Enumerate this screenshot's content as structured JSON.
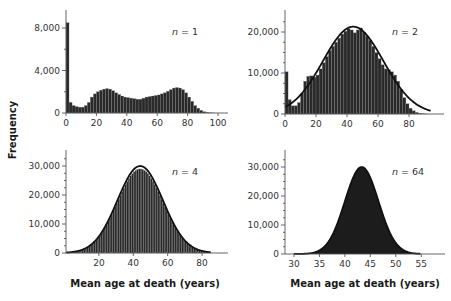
{
  "figure": {
    "ylabel": "Frequency",
    "xlabel": "Mean age at death (years)"
  },
  "chart_data": [
    {
      "type": "bar",
      "panel": "top-left",
      "annotation": "n = 1",
      "n_label": "n",
      "n_value": "= 1",
      "xlabel": "",
      "ylabel": "Frequency",
      "xticks": [
        0,
        20,
        40,
        60,
        80,
        100
      ],
      "yticks": [
        0,
        4000,
        8000
      ],
      "ytick_labels": [
        "0",
        "4,000",
        "8,000"
      ],
      "xlim": [
        0,
        106
      ],
      "ylim": [
        0,
        8000
      ],
      "bin_width": 2,
      "x": [
        0,
        2,
        4,
        6,
        8,
        10,
        12,
        14,
        16,
        18,
        20,
        22,
        24,
        26,
        28,
        30,
        32,
        34,
        36,
        38,
        40,
        42,
        44,
        46,
        48,
        50,
        52,
        54,
        56,
        58,
        60,
        62,
        64,
        66,
        68,
        70,
        72,
        74,
        76,
        78,
        80,
        82,
        84,
        86,
        88,
        90,
        92,
        94,
        96
      ],
      "values": [
        8500,
        1000,
        700,
        600,
        550,
        550,
        700,
        1000,
        1500,
        1800,
        2000,
        2150,
        2250,
        2300,
        2250,
        2100,
        1900,
        1750,
        1600,
        1500,
        1450,
        1400,
        1350,
        1300,
        1300,
        1400,
        1500,
        1550,
        1600,
        1650,
        1700,
        1800,
        1900,
        2050,
        2200,
        2350,
        2400,
        2350,
        2200,
        1900,
        1500,
        1100,
        700,
        450,
        250,
        130,
        60,
        20,
        5
      ],
      "grid": false
    },
    {
      "type": "bar",
      "panel": "top-right",
      "annotation": "n = 2",
      "n_label": "n",
      "n_value": "= 2",
      "xticks": [
        0,
        20,
        40,
        60,
        80
      ],
      "yticks": [
        0,
        10000,
        20000
      ],
      "ytick_labels": [
        "0",
        "10,000",
        "20,000"
      ],
      "xlim": [
        0,
        102
      ],
      "ylim": [
        0,
        20000
      ],
      "bin_width": 1,
      "x": [
        0,
        2,
        4,
        6,
        8,
        10,
        12,
        14,
        16,
        18,
        20,
        22,
        24,
        26,
        28,
        30,
        32,
        34,
        36,
        38,
        40,
        42,
        44,
        46,
        48,
        50,
        52,
        54,
        56,
        58,
        60,
        62,
        64,
        66,
        68,
        70,
        72,
        74,
        76,
        78,
        80,
        82,
        84,
        86,
        88,
        90
      ],
      "values": [
        10300,
        3500,
        2000,
        2000,
        2800,
        5000,
        8000,
        9200,
        9300,
        9000,
        9500,
        11000,
        12500,
        14000,
        15500,
        16500,
        17500,
        18500,
        19500,
        20200,
        20800,
        20500,
        19800,
        20500,
        21000,
        20000,
        19000,
        18000,
        16500,
        15000,
        13500,
        12000,
        11000,
        10800,
        10300,
        9500,
        8000,
        6000,
        4000,
        2500,
        1400,
        800,
        400,
        200,
        80,
        20
      ],
      "fit_curve": {
        "type": "normal",
        "mean": 44,
        "sd": 19.5,
        "peak": 21300
      },
      "grid": false
    },
    {
      "type": "bar",
      "panel": "bottom-left",
      "annotation": "n = 4",
      "n_label": "n",
      "n_value": "= 4",
      "xticks": [
        20,
        40,
        60,
        80
      ],
      "yticks": [
        0,
        10000,
        20000,
        30000
      ],
      "ytick_labels": [
        "0",
        "10,000",
        "20,000",
        "30,000"
      ],
      "xlim": [
        1,
        95
      ],
      "ylim": [
        0,
        30000
      ],
      "bin_width": 1,
      "fit_curve": {
        "type": "normal",
        "mean": 44,
        "sd": 13.2,
        "peak": 30000
      },
      "histogram": {
        "type": "normal",
        "mean": 44,
        "sd": 13.2,
        "peak": 29000
      },
      "grid": false
    },
    {
      "type": "bar",
      "panel": "bottom-right",
      "annotation": "n = 64",
      "n_label": "n",
      "n_value": "= 64",
      "xlabel": "Mean age at death (years)",
      "xticks": [
        30,
        35,
        40,
        45,
        50,
        55
      ],
      "yticks": [
        0,
        10000,
        20000,
        30000
      ],
      "ytick_labels": [
        "0",
        "10,000",
        "20,000",
        "30,000"
      ],
      "xlim": [
        28.2,
        59
      ],
      "ylim": [
        0,
        30000
      ],
      "fit_curve": {
        "type": "normal",
        "mean": 43.3,
        "sd": 3.3,
        "peak": 30000
      },
      "grid": false
    }
  ]
}
